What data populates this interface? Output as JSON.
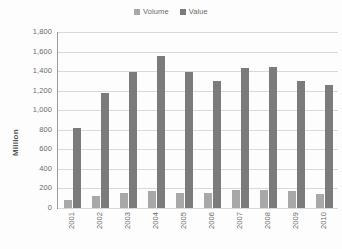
{
  "chart_data": {
    "type": "bar",
    "title": "",
    "subtitle": "",
    "xlabel": "",
    "ylabel": "Million",
    "categories": [
      "2001",
      "2002",
      "2003",
      "2004",
      "2005",
      "2006",
      "2007",
      "2008",
      "2009",
      "2010"
    ],
    "series": [
      {
        "name": "Volume",
        "color": "#a8a8a8",
        "values": [
          85,
          120,
          150,
          172,
          155,
          158,
          180,
          188,
          170,
          148
        ]
      },
      {
        "name": "Value",
        "color": "#7b7b7b",
        "values": [
          815,
          1175,
          1390,
          1550,
          1395,
          1295,
          1430,
          1445,
          1300,
          1260
        ]
      }
    ],
    "ylim": [
      0,
      1800
    ],
    "ytick_values": [
      0,
      200,
      400,
      600,
      800,
      1000,
      1200,
      1400,
      1600,
      1800
    ],
    "ytick_labels": [
      "0",
      "200",
      "400",
      "600",
      "800",
      "1,000",
      "1,200",
      "1,400",
      "1,600",
      "1,800"
    ],
    "grid": true,
    "grid_color": "#d9d9d9",
    "legend_position": "top-center",
    "xtick_rotation": -90,
    "background_color": "#ffffff"
  },
  "legend": {
    "items": [
      {
        "label": "Volume",
        "marker": "legend-swatch-volume"
      },
      {
        "label": "Value",
        "marker": "legend-swatch-value"
      }
    ]
  }
}
